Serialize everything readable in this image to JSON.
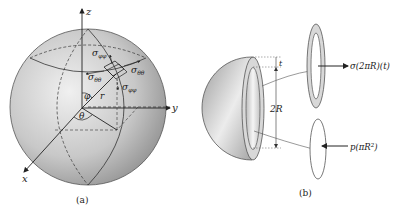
{
  "panel_a": {
    "caption": "(a)",
    "axes": {
      "z": "z",
      "y": "y",
      "x": "x"
    },
    "angles": {
      "phi": "φ",
      "theta": "θ"
    },
    "radius_label": "r",
    "stresses": {
      "sigma_phiphi_top": "σ",
      "sigma_phiphi_top_sub": "φφ",
      "sigma_thetatheta_left": "σ",
      "sigma_thetatheta_left_sub": "θθ",
      "sigma_thetatheta_right": "σ",
      "sigma_thetatheta_right_sub": "θθ",
      "sigma_phiphi_bottom": "σ",
      "sigma_phiphi_bottom_sub": "φφ"
    }
  },
  "panel_b": {
    "caption": "(b)",
    "thickness_label": "t",
    "diameter_label": "2R",
    "force_wall": "σ(2πR)(t)",
    "force_pressure_base": "p(πR",
    "force_pressure_sup": "2",
    "force_pressure_end": ")"
  },
  "colors": {
    "sphere_light": "#e6e6e6",
    "sphere_dark": "#9a9a9a",
    "line": "#333333"
  }
}
